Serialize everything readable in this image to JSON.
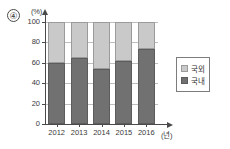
{
  "question_marker": "④",
  "chart_data": {
    "type": "bar",
    "stacked": true,
    "title": "",
    "xlabel": "(년)",
    "ylabel": "(%)",
    "categories": [
      "2012",
      "2013",
      "2014",
      "2015",
      "2016"
    ],
    "yticks": [
      "0",
      "20",
      "40",
      "60",
      "80",
      "100"
    ],
    "ylim": [
      0,
      100
    ],
    "grid": true,
    "legend_position": "right",
    "series": [
      {
        "name": "국내",
        "color": "#717171",
        "values": [
          60,
          65,
          54,
          62,
          74
        ]
      },
      {
        "name": "국외",
        "color": "#c9c9c9",
        "values": [
          40,
          35,
          46,
          38,
          26
        ]
      }
    ]
  },
  "legend": {
    "items": [
      {
        "label": "국외",
        "swatch": "light-gray-swatch"
      },
      {
        "label": "국내",
        "swatch": "dark-gray-swatch"
      }
    ]
  }
}
